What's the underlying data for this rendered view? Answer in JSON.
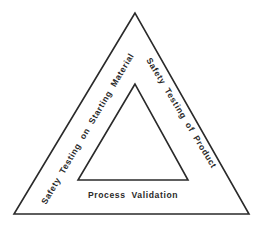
{
  "diagram": {
    "type": "nested-triangle",
    "outer_triangle": {
      "label_left_side": "Safety Testing on Starting Material",
      "label_right_side": "Safety Testing of Product",
      "label_bottom": "Process Validation"
    },
    "inner_triangle": {
      "label": ""
    },
    "colors": {
      "stroke": "#2a2a2a",
      "text": "#2a2a2a",
      "background": "#ffffff"
    }
  }
}
